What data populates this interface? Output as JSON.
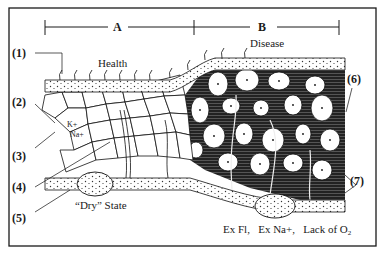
{
  "figure": {
    "sections": {
      "a": "A",
      "b": "B"
    },
    "regions": {
      "health": "Health",
      "disease": "Disease",
      "dry_state": "“Dry” State"
    },
    "ions": {
      "potassium": "K+",
      "sodium": "Na+"
    },
    "callouts": [
      "(1)",
      "(2)",
      "(3)",
      "(4)",
      "(5)",
      "(6)",
      "(7)"
    ],
    "disease_causes": {
      "fluid": "Ex Fl,",
      "sodium": "Ex Na+,",
      "oxygen_prefix": "Lack of O",
      "oxygen_sub": "2"
    },
    "colors": {
      "ink": "#1a1a1a",
      "paper": "#ffffff"
    }
  }
}
